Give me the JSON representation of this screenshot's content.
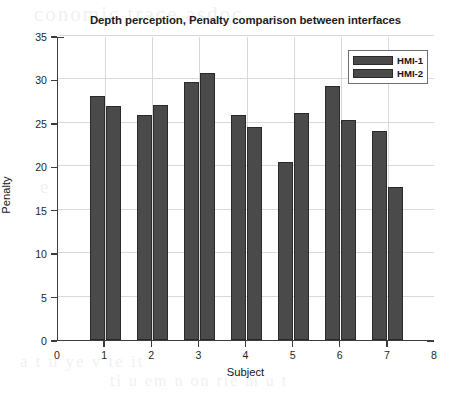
{
  "ghost_text": {
    "line1": "conomic trace asdoc",
    "line2": "ne nitantica i r tades",
    "line3": "e r u",
    "line4": "a t u ye v te it",
    "line5": "ti u em n on rie m u t"
  },
  "chart_data": {
    "type": "bar",
    "title": "Depth perception, Penalty comparison between interfaces",
    "xlabel": "Subject",
    "ylabel": "Penalty",
    "categories": [
      "1",
      "2",
      "3",
      "4",
      "5",
      "6",
      "7"
    ],
    "series": [
      {
        "name": "HMI-1",
        "color": "#4a4a4a",
        "values": [
          28.1,
          25.9,
          29.7,
          25.9,
          20.5,
          29.2,
          24.1
        ]
      },
      {
        "name": "HMI-2",
        "color": "#4a4a4a",
        "values": [
          26.9,
          27.1,
          30.7,
          24.5,
          26.1,
          25.3,
          17.6
        ]
      }
    ],
    "xlim": [
      0,
      8
    ],
    "ylim": [
      0,
      35
    ],
    "xticks": [
      "0",
      "1",
      "2",
      "3",
      "4",
      "5",
      "6",
      "7",
      "8"
    ],
    "yticks": [
      "0",
      "5",
      "10",
      "15",
      "20",
      "25",
      "30",
      "35"
    ],
    "grid": true,
    "legend_position": "upper right"
  }
}
